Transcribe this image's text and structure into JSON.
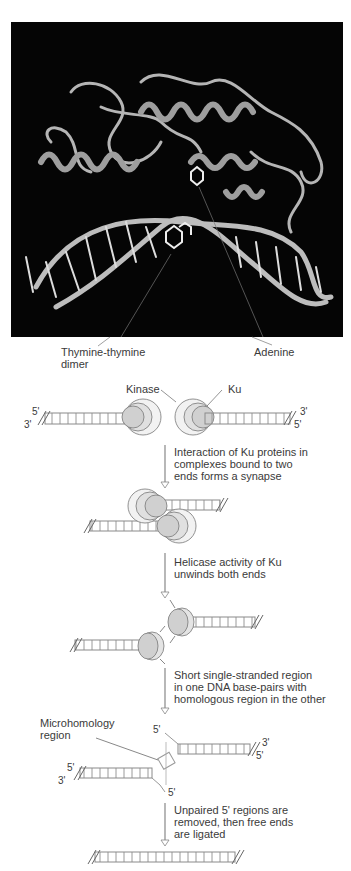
{
  "figure": {
    "structure_panel": {
      "description": "Ribbon model of DNA repair protein bound to DNA",
      "labels": {
        "dimer": "Thymine-thymine\ndimer",
        "adenine": "Adenine"
      }
    },
    "pathway": {
      "step1": {
        "labels": {
          "kinase": "Kinase",
          "ku": "Ku"
        },
        "ends": {
          "left_top": "5'",
          "left_bottom": "3'",
          "right_top": "3'",
          "right_bottom": "5'"
        }
      },
      "arrows": [
        {
          "text": "Interaction of Ku proteins in\ncomplexes bound to two\nends forms a synapse"
        },
        {
          "text": "Helicase activity of Ku\nunwinds both ends"
        },
        {
          "text": "Short single-stranded region\nin one DNA base-pairs with\nhomologous region in the other"
        },
        {
          "text": "Unpaired 5' regions are\nremoved, then free ends\nare ligated"
        }
      ],
      "step4": {
        "labels": {
          "microhomology": "Microhomology\nregion"
        },
        "ends": {
          "top_5": "5'",
          "right_top": "3'",
          "right_bottom": "5'",
          "left_top": "5'",
          "left_bottom": "3'",
          "bottom_5": "5'"
        }
      }
    },
    "colors": {
      "panel_bg": "#050505",
      "ribbon": "#b8b8b8",
      "protein_fill": "#d9d9d9",
      "protein_outer": "#eeeeee",
      "ladder": "#8a8a8a",
      "arrow": "#888888"
    }
  }
}
